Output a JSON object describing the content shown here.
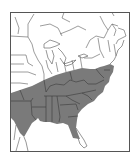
{
  "map": {
    "type": "species-range-map",
    "region": "Eastern United States",
    "legend": [],
    "colors": {
      "background": "#ffffff",
      "range_fill": "#7a7a7a",
      "border_lines": "#5a5a5a",
      "frame": "#555555"
    },
    "range": {
      "label": "shaded distribution area",
      "extent_description": "Southeastern US: eastern Texas/Oklahoma east to Atlantic coast, north to southern Illinois, Ohio, Pennsylvania and New Jersey, south to central Florida"
    }
  }
}
